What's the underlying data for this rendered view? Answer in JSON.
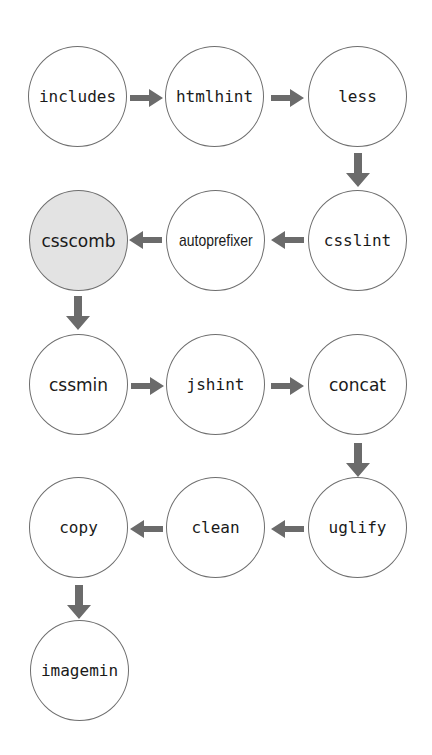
{
  "diagram": {
    "title": "",
    "arrow_color": "#6b6b6b",
    "node_border_color": "#6e6e6e",
    "highlight_fill": "#e3e3e3",
    "nodes": [
      {
        "id": "includes",
        "label": "includes",
        "row": 1,
        "col": 1,
        "highlighted": false
      },
      {
        "id": "htmlhint",
        "label": "htmlhint",
        "row": 1,
        "col": 2,
        "highlighted": false
      },
      {
        "id": "less",
        "label": "less",
        "row": 1,
        "col": 3,
        "highlighted": false
      },
      {
        "id": "csslint",
        "label": "csslint",
        "row": 2,
        "col": 3,
        "highlighted": false
      },
      {
        "id": "autoprefixer",
        "label": "autoprefixer",
        "row": 2,
        "col": 2,
        "highlighted": false
      },
      {
        "id": "csscomb",
        "label": "csscomb",
        "row": 2,
        "col": 1,
        "highlighted": true
      },
      {
        "id": "cssmin",
        "label": "cssmin",
        "row": 3,
        "col": 1,
        "highlighted": false
      },
      {
        "id": "jshint",
        "label": "jshint",
        "row": 3,
        "col": 2,
        "highlighted": false
      },
      {
        "id": "concat",
        "label": "concat",
        "row": 3,
        "col": 3,
        "highlighted": false
      },
      {
        "id": "uglify",
        "label": "uglify",
        "row": 4,
        "col": 3,
        "highlighted": false
      },
      {
        "id": "clean",
        "label": "clean",
        "row": 4,
        "col": 2,
        "highlighted": false
      },
      {
        "id": "copy",
        "label": "copy",
        "row": 4,
        "col": 1,
        "highlighted": false
      },
      {
        "id": "imagemin",
        "label": "imagemin",
        "row": 5,
        "col": 1,
        "highlighted": false
      }
    ],
    "edges": [
      {
        "from": "includes",
        "to": "htmlhint",
        "direction": "right"
      },
      {
        "from": "htmlhint",
        "to": "less",
        "direction": "right"
      },
      {
        "from": "less",
        "to": "csslint",
        "direction": "down"
      },
      {
        "from": "csslint",
        "to": "autoprefixer",
        "direction": "left"
      },
      {
        "from": "autoprefixer",
        "to": "csscomb",
        "direction": "left"
      },
      {
        "from": "csscomb",
        "to": "cssmin",
        "direction": "down"
      },
      {
        "from": "cssmin",
        "to": "jshint",
        "direction": "right"
      },
      {
        "from": "jshint",
        "to": "concat",
        "direction": "right"
      },
      {
        "from": "concat",
        "to": "uglify",
        "direction": "down"
      },
      {
        "from": "uglify",
        "to": "clean",
        "direction": "left"
      },
      {
        "from": "clean",
        "to": "copy",
        "direction": "left"
      },
      {
        "from": "copy",
        "to": "imagemin",
        "direction": "down"
      }
    ]
  }
}
